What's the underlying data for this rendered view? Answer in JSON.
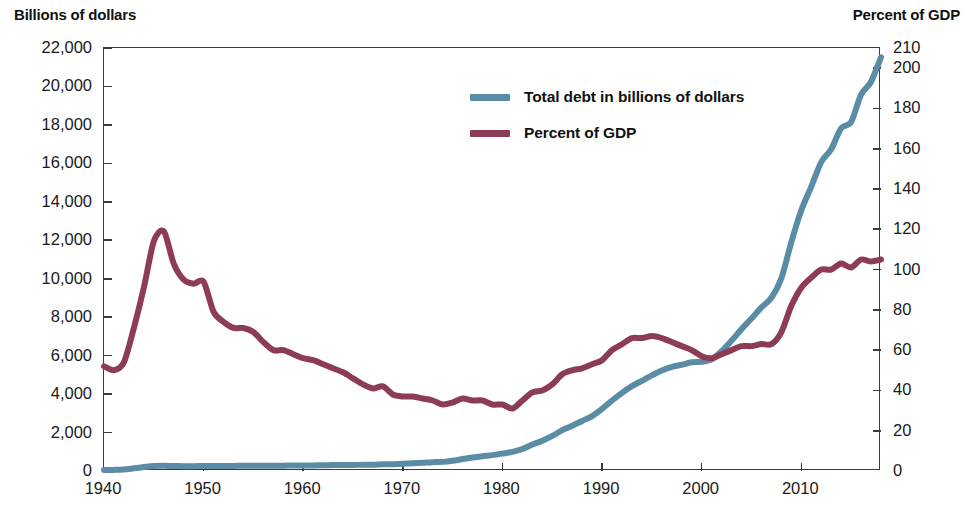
{
  "axis_titles": {
    "left": "Billions of dollars",
    "right": "Percent of GDP"
  },
  "legend": {
    "items": [
      {
        "label": "Total debt in billions of dollars",
        "color": "#5b8ca6"
      },
      {
        "label": "Percent of GDP",
        "color": "#8d3c55"
      }
    ]
  },
  "colors": {
    "debt_line": "#5b8ca6",
    "gdp_line": "#8d3c55",
    "frame": "#3b3b3b",
    "text": "#1a1a1a",
    "background": "#ffffff"
  },
  "chart_data": {
    "type": "line",
    "title": "",
    "subtitle": "",
    "xlabel": "",
    "ylabel": "Billions of dollars",
    "y2label": "Percent of GDP",
    "xlim": [
      1940,
      2018
    ],
    "ylim": [
      0,
      22000
    ],
    "y2lim": [
      0,
      210
    ],
    "grid": false,
    "legend_position": "inside-top-center",
    "xticks": [
      1940,
      1950,
      1960,
      1970,
      1980,
      1990,
      2000,
      2010
    ],
    "xticklabels": [
      "1940",
      "1950",
      "1960",
      "1970",
      "1980",
      "1990",
      "2000",
      "2010"
    ],
    "yticks": [
      0,
      2000,
      4000,
      6000,
      8000,
      10000,
      12000,
      14000,
      16000,
      18000,
      20000,
      22000
    ],
    "yticklabels": [
      "0",
      "2,000",
      "4,000",
      "6,000",
      "8,000",
      "10,000",
      "12,000",
      "14,000",
      "16,000",
      "18,000",
      "20,000",
      "22,000"
    ],
    "y2ticks": [
      0,
      20,
      40,
      60,
      80,
      100,
      120,
      140,
      160,
      180,
      200,
      210
    ],
    "y2ticklabels": [
      "0",
      "20",
      "40",
      "60",
      "80",
      "100",
      "120",
      "140",
      "160",
      "180",
      "200",
      "210"
    ],
    "x": [
      1940,
      1941,
      1942,
      1943,
      1944,
      1945,
      1946,
      1947,
      1948,
      1949,
      1950,
      1951,
      1952,
      1953,
      1954,
      1955,
      1956,
      1957,
      1958,
      1959,
      1960,
      1961,
      1962,
      1963,
      1964,
      1965,
      1966,
      1967,
      1968,
      1969,
      1970,
      1971,
      1972,
      1973,
      1974,
      1975,
      1976,
      1977,
      1978,
      1979,
      1980,
      1981,
      1982,
      1983,
      1984,
      1985,
      1986,
      1987,
      1988,
      1989,
      1990,
      1991,
      1992,
      1993,
      1994,
      1995,
      1996,
      1997,
      1998,
      1999,
      2000,
      2001,
      2002,
      2003,
      2004,
      2005,
      2006,
      2007,
      2008,
      2009,
      2010,
      2011,
      2012,
      2013,
      2014,
      2015,
      2016,
      2017,
      2018
    ],
    "series": [
      {
        "name": "Total debt in billions of dollars",
        "axis": "left",
        "units": "billions of dollars",
        "color": "#5b8ca6",
        "values": [
          51,
          58,
          79,
          143,
          204,
          260,
          271,
          257,
          252,
          253,
          257,
          255,
          259,
          266,
          271,
          274,
          273,
          271,
          276,
          285,
          286,
          289,
          298,
          306,
          312,
          317,
          320,
          326,
          348,
          354,
          371,
          398,
          427,
          458,
          475,
          533,
          620,
          699,
          772,
          827,
          908,
          998,
          1142,
          1377,
          1572,
          1823,
          2125,
          2350,
          2602,
          2857,
          3233,
          3665,
          4065,
          4411,
          4693,
          4974,
          5225,
          5413,
          5526,
          5656,
          5674,
          5807,
          6228,
          6783,
          7379,
          7933,
          8507,
          9008,
          10025,
          11910,
          13562,
          14790,
          16066,
          16738,
          17824,
          18151,
          19573,
          20245,
          21516
        ]
      },
      {
        "name": "Percent of GDP",
        "axis": "right",
        "units": "percent of GDP",
        "color": "#8d3c55",
        "values": [
          52,
          50,
          54,
          71,
          91,
          114,
          119,
          103,
          95,
          93,
          94,
          79,
          74,
          71,
          71,
          69,
          64,
          60,
          60,
          58,
          56,
          55,
          53,
          51,
          49,
          46,
          43,
          41,
          42,
          38,
          37,
          37,
          36,
          35,
          33,
          34,
          36,
          35,
          35,
          33,
          33,
          31,
          35,
          39,
          40,
          43,
          48,
          50,
          51,
          53,
          55,
          60,
          63,
          66,
          66,
          67,
          66,
          64,
          62,
          60,
          57,
          56,
          58,
          60,
          62,
          62,
          63,
          63,
          69,
          82,
          91,
          96,
          100,
          100,
          103,
          101,
          105,
          104,
          105
        ]
      }
    ],
    "notes": {
      "crossover_year": 2001,
      "gdp_peak": {
        "year": 1946,
        "value": 119
      },
      "gdp_trough": {
        "year": 1981,
        "value": 31
      },
      "debt_final": {
        "year": 2018,
        "value": 21516
      }
    }
  }
}
